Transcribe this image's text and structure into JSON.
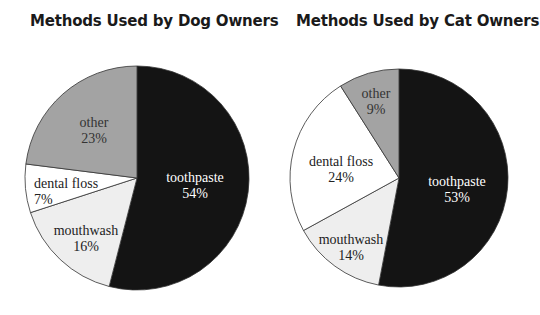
{
  "chart_data": [
    {
      "type": "pie",
      "title": "Methods Used by Dog Owners",
      "categories": [
        "toothpaste",
        "mouthwash",
        "dental floss",
        "other"
      ],
      "values": [
        54,
        16,
        7,
        23
      ],
      "labels": [
        "54%",
        "16%",
        "7%",
        "23%"
      ],
      "colors": [
        "#141414",
        "#eeeeee",
        "#ffffff",
        "#a3a3a3"
      ],
      "start_angle": "12 o'clock, clockwise",
      "legend": "none (labels inside slices)"
    },
    {
      "type": "pie",
      "title": "Methods Used by Cat Owners",
      "categories": [
        "toothpaste",
        "mouthwash",
        "dental floss",
        "other"
      ],
      "values": [
        53,
        14,
        24,
        9
      ],
      "labels": [
        "53%",
        "14%",
        "24%",
        "9%"
      ],
      "colors": [
        "#141414",
        "#eeeeee",
        "#ffffff",
        "#a3a3a3"
      ],
      "start_angle": "12 o'clock, clockwise",
      "legend": "none (labels inside slices)"
    }
  ],
  "charts": [
    {
      "title": "Methods Used by Dog Owners",
      "slices": [
        {
          "name": "toothpaste",
          "pct": "54%"
        },
        {
          "name": "mouthwash",
          "pct": "16%"
        },
        {
          "name": "dental floss",
          "pct": "7%"
        },
        {
          "name": "other",
          "pct": "23%"
        }
      ]
    },
    {
      "title": "Methods Used by Cat Owners",
      "slices": [
        {
          "name": "toothpaste",
          "pct": "53%"
        },
        {
          "name": "mouthwash",
          "pct": "14%"
        },
        {
          "name": "dental floss",
          "pct": "24%"
        },
        {
          "name": "other",
          "pct": "9%"
        }
      ]
    }
  ]
}
